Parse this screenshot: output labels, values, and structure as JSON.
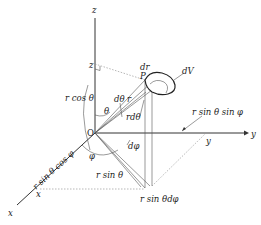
{
  "diagram": {
    "axes": {
      "z": "z",
      "y": "y",
      "x": "x"
    },
    "origin": "O",
    "point": "P",
    "projections": {
      "z_foot": "z",
      "x_foot": "x",
      "y_foot": "y"
    },
    "labels": {
      "r_cos_theta": "r cos θ",
      "theta": "θ",
      "d_theta": "dθ",
      "r": "r",
      "r_d_theta": "rdθ",
      "dr": "dr",
      "dV": "dV",
      "phi": "φ",
      "d_phi": "dφ",
      "r_sin_theta": "r sin θ",
      "r_sin_theta_cos_phi": "r sin θ cos φ",
      "r_sin_theta_sin_phi": "r sin θ sin φ",
      "r_sin_theta_d_phi": "r sin θdφ"
    }
  }
}
